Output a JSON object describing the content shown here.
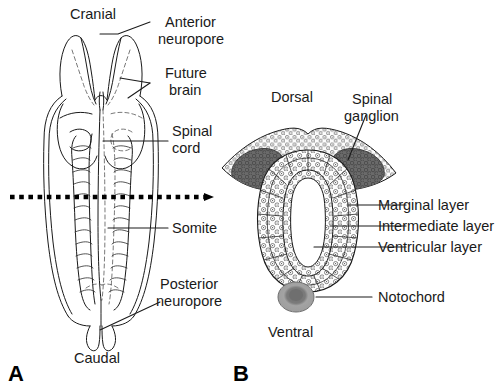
{
  "figure": {
    "background_color": "#ffffff",
    "ink_color": "#1a1a1a",
    "ganglion_color": "#6a6a6a",
    "notochord_color": "#9b9b9b",
    "notochord_core_color": "#6f6f6f",
    "cell_fill_color": "#fdfdfd"
  },
  "panel_a": {
    "letter": "A",
    "labels": {
      "cranial": "Cranial",
      "anterior_neuropore_line1": "Anterior",
      "anterior_neuropore_line2": "neuropore",
      "future_brain_line1": "Future",
      "future_brain_line2": "brain",
      "spinal_cord_line1": "Spinal",
      "spinal_cord_line2": "cord",
      "somite": "Somite",
      "posterior_neuropore_line1": "Posterior",
      "posterior_neuropore_line2": "neuropore",
      "caudal": "Caudal"
    }
  },
  "panel_b": {
    "letter": "B",
    "labels": {
      "dorsal": "Dorsal",
      "spinal_ganglion_line1": "Spinal",
      "spinal_ganglion_line2": "ganglion",
      "marginal_layer": "Marginal layer",
      "intermediate_layer": "Intermediate layer",
      "ventricular_layer": "Ventricular layer",
      "notochord": "Notochord",
      "ventral": "Ventral"
    }
  }
}
